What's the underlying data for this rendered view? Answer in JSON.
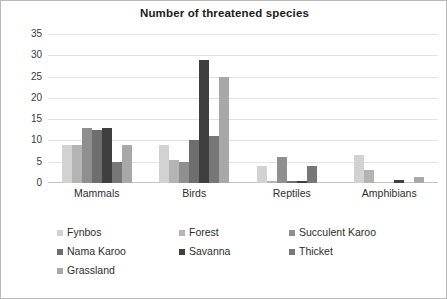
{
  "chart_data": {
    "type": "bar",
    "title": "Number of threatened species",
    "xlabel": "",
    "ylabel": "",
    "ylim": [
      0,
      35
    ],
    "ytick_step": 5,
    "yticks": [
      35,
      30,
      25,
      20,
      15,
      10,
      5,
      0
    ],
    "grid": true,
    "legend_position": "bottom",
    "categories": [
      "Mammals",
      "Birds",
      "Reptiles",
      "Amphibians"
    ],
    "series": [
      {
        "name": "Fynbos",
        "color": "#d2d2d2",
        "values": [
          9,
          9,
          4,
          6.5
        ]
      },
      {
        "name": "Forest",
        "color": "#b4b4b4",
        "values": [
          9,
          5.5,
          0.5,
          3
        ]
      },
      {
        "name": "Succulent Karoo",
        "color": "#8f8f8f",
        "values": [
          13,
          5,
          6,
          0
        ]
      },
      {
        "name": "Nama Karoo",
        "color": "#6e6e6e",
        "values": [
          12.5,
          10,
          0.5,
          0
        ]
      },
      {
        "name": "Savanna",
        "color": "#3f3f3f",
        "values": [
          13,
          29,
          0.5,
          0.7
        ]
      },
      {
        "name": "Thicket",
        "color": "#777777",
        "values": [
          5,
          11,
          4,
          0
        ]
      },
      {
        "name": "Grassland",
        "color": "#a8a8a8",
        "values": [
          9,
          25,
          0,
          1.3
        ]
      }
    ]
  },
  "legend": {
    "rows": [
      [
        {
          "label": "Fynbos",
          "color": "#d2d2d2"
        },
        {
          "label": "Forest",
          "color": "#b4b4b4"
        },
        {
          "label": "Succulent Karoo",
          "color": "#8f8f8f"
        }
      ],
      [
        {
          "label": "Nama Karoo",
          "color": "#6e6e6e"
        },
        {
          "label": "Savanna",
          "color": "#3f3f3f"
        },
        {
          "label": "Thicket",
          "color": "#777777"
        }
      ],
      [
        {
          "label": "Grassland",
          "color": "#a8a8a8"
        }
      ]
    ]
  }
}
